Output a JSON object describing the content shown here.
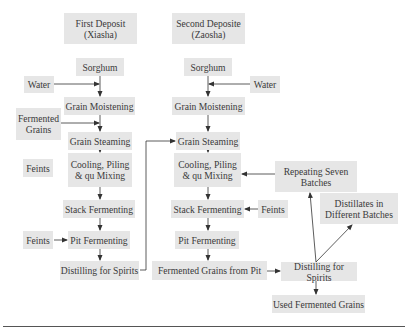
{
  "first_deposit": {
    "header": "First Deposit\n(Xiasha)",
    "steps": [
      "Sorghum",
      "Grain Moistening",
      "Grain Steaming",
      "Cooling, Piling\n& qu Mixing",
      "Stack Fermenting",
      "Pit Fermenting",
      "Distilling for Spirits"
    ],
    "inputs": {
      "water": "Water",
      "fermented_grains": "Fermented\nGrains",
      "feints_cooling": "Feints",
      "feints_pit": "Feints"
    }
  },
  "second_deposit": {
    "header": "Second Deposite\n(Zaosha)",
    "steps": [
      "Sorghum",
      "Grain Moistening",
      "Grain Steaming",
      "Cooling, Piling\n& qu Mixing",
      "Stack Fermenting",
      "Pit Fermenting",
      "Fermented Grains from Pit",
      "Distilling for Spirits",
      "Used Fermented Grains"
    ],
    "inputs": {
      "water": "Water",
      "feints_stack": "Feints"
    },
    "outputs": {
      "repeating": "Repeating Seven\nBatches",
      "distillates": "Distillates in\nDifferent Batches"
    }
  },
  "colors": {
    "box_fill": "#e6e6e6",
    "line": "#333333",
    "text": "#3a3a3a"
  }
}
